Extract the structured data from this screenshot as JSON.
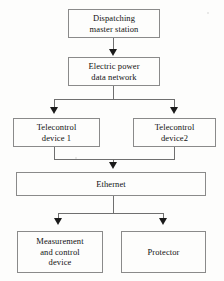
{
  "diagram": {
    "colors": {
      "background": "#fdfdfc",
      "box_border": "#8a8a8a",
      "connector": "#6f6f6f",
      "arrowhead": "#1a1a1a",
      "text": "#111111"
    },
    "nodes": [
      {
        "id": "dispatching",
        "label": "Dispatching master station",
        "lines": [
          "Dispatching",
          "master station"
        ]
      },
      {
        "id": "network",
        "label": "Electric power data network",
        "lines": [
          "Electric power",
          "data network"
        ]
      },
      {
        "id": "telecontrol1",
        "label": "Telecontrol device 1",
        "lines": [
          "Telecontrol",
          "device 1"
        ]
      },
      {
        "id": "telecontrol2",
        "label": "Telecontrol device2",
        "lines": [
          "Telecontrol",
          "device2"
        ]
      },
      {
        "id": "ethernet",
        "label": "Ethernet",
        "lines": [
          "Ethernet"
        ]
      },
      {
        "id": "measurement",
        "label": "Measurement and control device",
        "lines": [
          "Measurement",
          "and control",
          "device"
        ]
      },
      {
        "id": "protector",
        "label": "Protector",
        "lines": [
          "Protector"
        ]
      }
    ],
    "edges": [
      {
        "from": "dispatching",
        "to": "network",
        "style": "arrow"
      },
      {
        "from": "network",
        "to": "telecontrol1",
        "style": "arrow"
      },
      {
        "from": "network",
        "to": "telecontrol2",
        "style": "arrow"
      },
      {
        "from": "telecontrol1",
        "to": "ethernet",
        "style": "arrow"
      },
      {
        "from": "telecontrol2",
        "to": "ethernet",
        "style": "arrow"
      },
      {
        "from": "ethernet",
        "to": "measurement",
        "style": "arrow"
      },
      {
        "from": "ethernet",
        "to": "protector",
        "style": "arrow"
      }
    ]
  }
}
